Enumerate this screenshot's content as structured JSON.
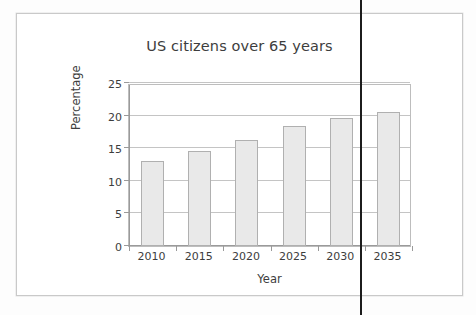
{
  "page": {
    "background_color": "#fdfdfd",
    "frame_border_color": "#c9c9c9"
  },
  "artifact": {
    "spine_line_name": "scan-spine-line",
    "color": "#1c1c1c"
  },
  "chart_data": {
    "type": "bar",
    "title": "US citizens over 65 years",
    "xlabel": "Year",
    "ylabel": "Percentage",
    "categories": [
      "2010",
      "2015",
      "2020",
      "2025",
      "2030",
      "2035"
    ],
    "values": [
      13.0,
      14.5,
      16.3,
      18.4,
      19.7,
      20.5
    ],
    "ylim": [
      0,
      25
    ],
    "yticks": [
      0,
      5,
      10,
      15,
      20,
      25
    ],
    "ytick_labels": [
      "0",
      "5",
      "10",
      "15",
      "20",
      "25"
    ],
    "grid": true,
    "grid_axis": "y",
    "legend": false,
    "bar_fill_color": "#e9e9e9",
    "bar_border_color": "#b0b0b0",
    "axis_color": "#9a9a9a",
    "grid_color": "#c4c4c4",
    "text_color": "#3d3d3d"
  }
}
